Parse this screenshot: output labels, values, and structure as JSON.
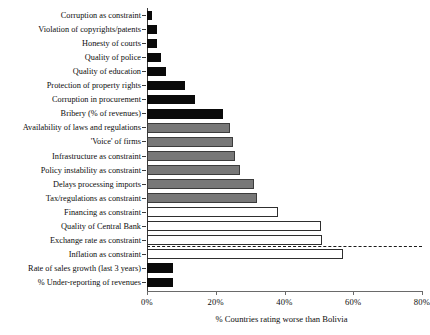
{
  "chart_data": {
    "type": "bar",
    "orientation": "horizontal",
    "title": "",
    "xlabel": "% Countries rating worse than Bolivia",
    "ylabel": "",
    "xlim": [
      0,
      80
    ],
    "xticks": [
      0,
      20,
      40,
      60,
      80
    ],
    "xtick_labels": [
      "0%",
      "20%",
      "40%",
      "60%",
      "80%"
    ],
    "grid": false,
    "legend": false,
    "separator_after_index": 15,
    "colors": {
      "solid": "#0a0a0a",
      "gray": "#787878",
      "hollow": "#ffffff",
      "axis": "#3a3a3a"
    },
    "categories": [
      "Corruption as constraint",
      "Violation of copyrights/patents",
      "Honesty of courts",
      "Quality of police",
      "Quality of education",
      "Protection of property rights",
      "Corruption in procurement",
      "Bribery (% of revenues)",
      "Availability of laws and regulations",
      "'Voice' of firms",
      "Infrastructure as constraint",
      "Policy instability as constraint",
      "Delays processing imports",
      "Tax/regulations as constraint",
      "Financing as constraint",
      "Quality of Central Bank",
      "Exchange rate as constraint",
      "Inflation as constraint",
      "Rate of sales growth (last 3 years)",
      "% Under-reporting of revenues"
    ],
    "values": [
      1.5,
      3,
      3,
      4,
      5.5,
      11,
      14,
      22,
      24,
      25,
      25.5,
      27,
      31,
      32,
      38,
      50.5,
      51,
      57,
      7.5,
      7.5
    ],
    "styles": [
      "solid",
      "solid",
      "solid",
      "solid",
      "solid",
      "solid",
      "solid",
      "solid",
      "gray",
      "gray",
      "gray",
      "gray",
      "gray",
      "gray",
      "hollow",
      "hollow",
      "hollow",
      "hollow",
      "solid",
      "solid"
    ]
  }
}
